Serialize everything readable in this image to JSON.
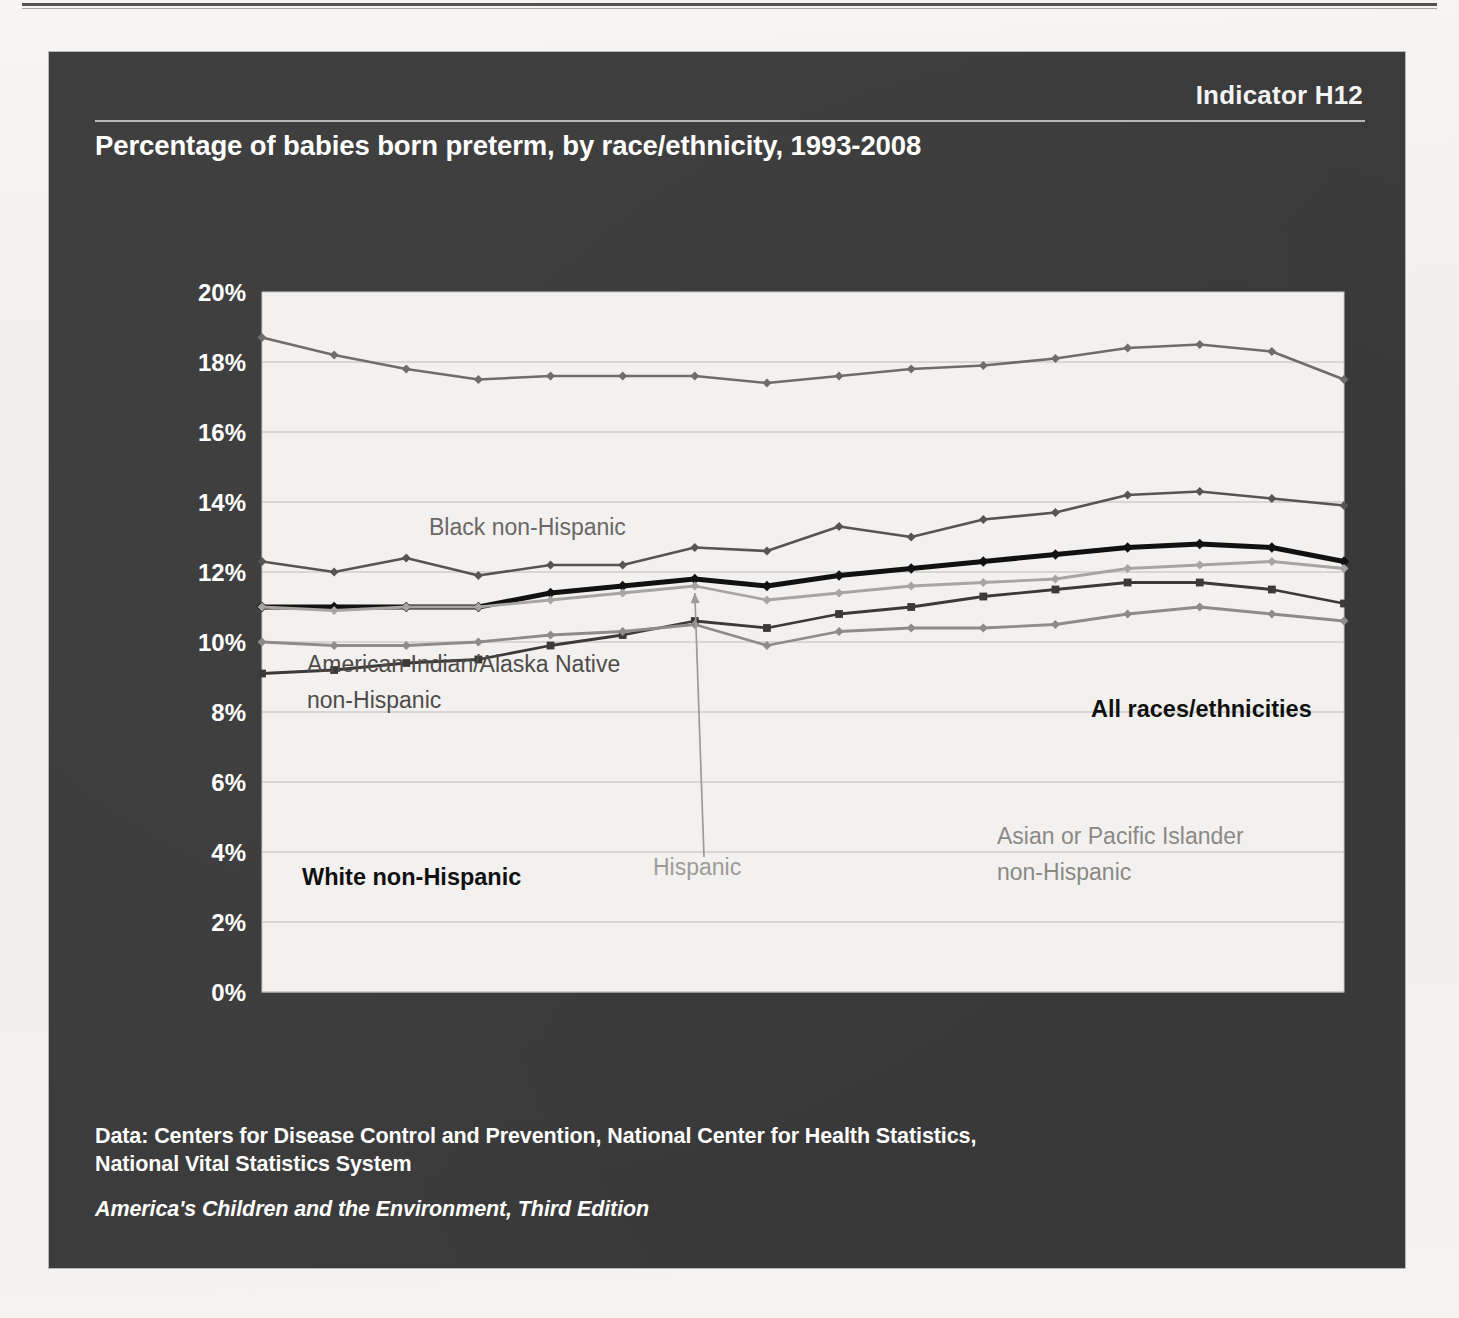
{
  "panel": {
    "indicator": "Indicator H12",
    "title": "Percentage of babies born preterm, by race/ethnicity, 1993-2008"
  },
  "footer": {
    "source_line1": "Data: Centers for Disease Control and Prevention, National Center for Health Statistics,",
    "source_line2": "National Vital Statistics System",
    "publication": "America's Children and the Environment, Third Edition"
  },
  "colors": {
    "panel_bg": "#3d3c3c",
    "plot_bg": "#f2f1ef",
    "gridline": "#b5b3b0",
    "all_races": "#111111",
    "black_nh": "#6f6d6b",
    "ai_an_nh": "#575553",
    "hispanic": "#a7a5a2",
    "white_nh": "#3c3a38",
    "asian_pi_nh": "#8e8c89",
    "tick_text": "#ffffff"
  },
  "chart_data": {
    "type": "line",
    "title": "Percentage of babies born preterm, by race/ethnicity, 1993-2008",
    "xlabel": "",
    "ylabel": "",
    "ylim": [
      0,
      20
    ],
    "ytick_labels": [
      "0%",
      "2%",
      "4%",
      "6%",
      "8%",
      "10%",
      "12%",
      "14%",
      "16%",
      "18%",
      "20%"
    ],
    "ytick_values": [
      0,
      2,
      4,
      6,
      8,
      10,
      12,
      14,
      16,
      18,
      20
    ],
    "grid": true,
    "legend_position": "inline-annotations",
    "x": [
      1993,
      1994,
      1995,
      1996,
      1997,
      1998,
      1999,
      2000,
      2001,
      2002,
      2003,
      2004,
      2005,
      2006,
      2007,
      2008
    ],
    "xtick_labels": [
      "1993",
      "1996",
      "1998",
      "2000",
      "2002",
      "2004",
      "2006",
      "2008"
    ],
    "xtick_values": [
      1993,
      1996,
      1998,
      2000,
      2002,
      2004,
      2006,
      2008
    ],
    "series": [
      {
        "name": "Black non-Hispanic",
        "color": "#6f6d6b",
        "marker": "diamond",
        "width": 2.6,
        "values": [
          18.7,
          18.2,
          17.8,
          17.5,
          17.6,
          17.6,
          17.6,
          17.4,
          17.6,
          17.8,
          17.9,
          18.1,
          18.4,
          18.5,
          18.3,
          17.5
        ]
      },
      {
        "name": "American Indian/Alaska Native non-Hispanic",
        "color": "#575553",
        "marker": "diamond",
        "width": 2.6,
        "values": [
          12.3,
          12.0,
          12.4,
          11.9,
          12.2,
          12.2,
          12.7,
          12.6,
          13.3,
          13.0,
          13.5,
          13.7,
          14.2,
          14.3,
          14.1,
          13.9
        ]
      },
      {
        "name": "All races/ethnicities",
        "color": "#111111",
        "marker": "diamond",
        "width": 5.0,
        "values": [
          11.0,
          11.0,
          11.0,
          11.0,
          11.4,
          11.6,
          11.8,
          11.6,
          11.9,
          12.1,
          12.3,
          12.5,
          12.7,
          12.8,
          12.7,
          12.3
        ]
      },
      {
        "name": "Hispanic",
        "color": "#a7a5a2",
        "marker": "diamond",
        "width": 2.8,
        "values": [
          11.0,
          10.9,
          11.0,
          11.0,
          11.2,
          11.4,
          11.6,
          11.2,
          11.4,
          11.6,
          11.7,
          11.8,
          12.1,
          12.2,
          12.3,
          12.1
        ]
      },
      {
        "name": "White non-Hispanic",
        "color": "#3c3a38",
        "marker": "square",
        "width": 2.8,
        "values": [
          9.1,
          9.2,
          9.4,
          9.5,
          9.9,
          10.2,
          10.6,
          10.4,
          10.8,
          11.0,
          11.3,
          11.5,
          11.7,
          11.7,
          11.5,
          11.1
        ]
      },
      {
        "name": "Asian or Pacific Islander non-Hispanic",
        "color": "#8e8c89",
        "marker": "diamond",
        "width": 2.8,
        "values": [
          10.0,
          9.9,
          9.9,
          10.0,
          10.2,
          10.3,
          10.5,
          9.9,
          10.3,
          10.4,
          10.4,
          10.5,
          10.8,
          11.0,
          10.8,
          10.6
        ]
      }
    ],
    "annotations": [
      {
        "id": "ann-black",
        "text": "Black non-Hispanic",
        "x": 380,
        "y": 305,
        "bold": false,
        "color": "#6a6866"
      },
      {
        "id": "ann-aian-1",
        "text": "American Indian/Alaska Native",
        "x": 258,
        "y": 442,
        "bold": false,
        "color": "#4e4c4a"
      },
      {
        "id": "ann-aian-2",
        "text": "non-Hispanic",
        "x": 258,
        "y": 478,
        "bold": false,
        "color": "#4e4c4a"
      },
      {
        "id": "ann-allraces",
        "text": "All races/ethnicities",
        "x": 1042,
        "y": 487,
        "bold": true,
        "color": "#111111"
      },
      {
        "id": "ann-white",
        "text": "White non-Hispanic",
        "x": 253,
        "y": 655,
        "bold": true,
        "color": "#1a1a1a"
      },
      {
        "id": "ann-hispanic",
        "text": "Hispanic",
        "x": 604,
        "y": 645,
        "bold": false,
        "color": "#9d9b98"
      },
      {
        "id": "ann-asian-1",
        "text": "Asian or Pacific Islander",
        "x": 948,
        "y": 614,
        "bold": false,
        "color": "#8b8986"
      },
      {
        "id": "ann-asian-2",
        "text": "non-Hispanic",
        "x": 948,
        "y": 650,
        "bold": false,
        "color": "#8b8986"
      }
    ]
  }
}
